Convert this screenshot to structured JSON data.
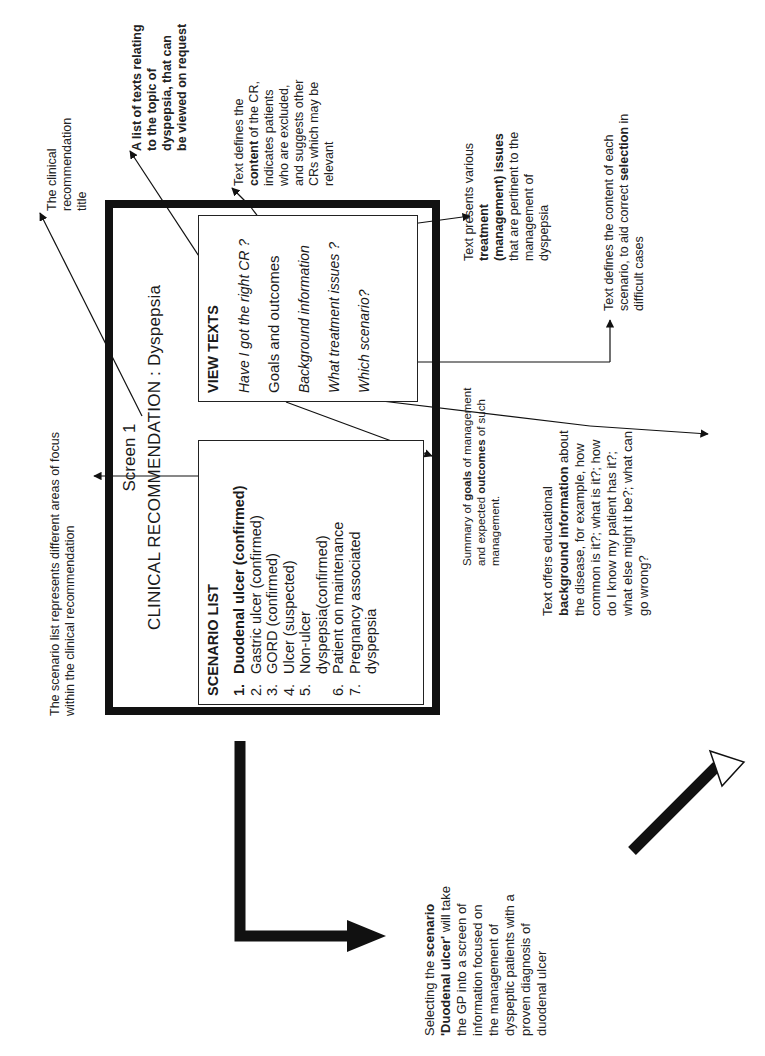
{
  "diagram": {
    "orientation": "rotated 90 degrees counter-clockwise",
    "screen": {
      "label": "Screen 1",
      "title": "CLINICAL RECOMMENDATION : Dyspepsia"
    },
    "scenario_list": {
      "heading": "SCENARIO LIST",
      "items": [
        {
          "num": "1.",
          "text": "Duodenal ulcer (confirmed)",
          "bold": true
        },
        {
          "num": "2.",
          "text": "Gastric ulcer (confirmed)"
        },
        {
          "num": "3.",
          "text": "GORD (confirmed)"
        },
        {
          "num": "4.",
          "text": "Ulcer (suspected)"
        },
        {
          "num": "5.",
          "text": "Non-ulcer dyspepsia(confirmed)"
        },
        {
          "num": "6.",
          "text": "Patient on maintenance"
        },
        {
          "num": "7.",
          "text": "Pregnancy associated dyspepsia"
        }
      ]
    },
    "view_texts": {
      "heading": "VIEW TEXTS",
      "items": [
        {
          "text": "Have I got the right CR ?",
          "italic": true
        },
        {
          "text": "Goals and outcomes",
          "italic": false
        },
        {
          "text": "Background information",
          "italic": true
        },
        {
          "text": "What treatment issues ?",
          "italic": true
        },
        {
          "text": "Which scenario?",
          "italic": true
        }
      ]
    },
    "annotations": {
      "title_note": "The clinical recommendation title",
      "view_texts_note": {
        "bold": "A list of texts relating to the topic of dyspepsia, that can be viewed on request"
      },
      "right_cr_note": {
        "pre": "Text defines the ",
        "bold": "content",
        "post": " of the CR, indicates patients who are excluded, and suggests other CRs which may be relevant"
      },
      "treatment_note": {
        "pre": "Text presents various ",
        "bold": "treatment (management) issues",
        "post": " that are pertinent to the management of dyspepsia"
      },
      "scenario_note": {
        "pre": "Text defines the content of each scenario, to aid correct ",
        "bold": "selection",
        "post": " in difficult cases"
      },
      "scenario_list_note": "The scenario list represents different areas of focus within the clinical recommendation",
      "goals_note": {
        "pre": "Summary of ",
        "bold1": "goals",
        "mid": " of management and expected ",
        "bold2": "outcomes",
        "post": " of such management."
      },
      "background_note": {
        "pre": "Text offers educational ",
        "bold": "background information",
        "post": " about the disease, for example, how common is it?; what is it?; how do I know my patient has it?; what else might it be?; what can go wrong?"
      },
      "selecting_note": {
        "pre": "Selecting  the ",
        "bold1": "scenario",
        "bold2": "'Duodenal ulcer'",
        "post": " will take the GP into a screen of information focused on the management of dyspeptic patients with a proven diagnosis of duodenal ulcer"
      }
    },
    "colors": {
      "ink": "#111111",
      "background": "#ffffff"
    }
  }
}
